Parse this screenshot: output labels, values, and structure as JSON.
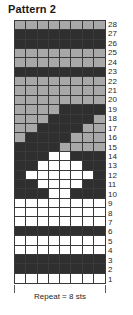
{
  "title": "Pattern 2",
  "footer": {
    "repeat_label": "Repeat = 8 sts"
  },
  "colors": {
    "light": "#a8a8a8",
    "dark": "#2f2f2f",
    "white": "#ffffff",
    "grid_line": "#3a3a3a",
    "text": "#1f1f1f"
  },
  "chart_data": {
    "type": "table",
    "title": "Pattern 2",
    "xlabel": "Repeat = 8 sts",
    "ylabel": "",
    "columns": 8,
    "rows": 28,
    "legend": [
      {
        "key": "L",
        "color": "#a8a8a8",
        "name": "light gray"
      },
      {
        "key": "D",
        "color": "#2f2f2f",
        "name": "dark gray"
      },
      {
        "key": "W",
        "color": "#ffffff",
        "name": "white"
      }
    ],
    "row_numbers": [
      28,
      27,
      26,
      25,
      24,
      23,
      22,
      21,
      20,
      19,
      18,
      17,
      16,
      15,
      14,
      13,
      12,
      11,
      10,
      9,
      8,
      7,
      6,
      5,
      4,
      3,
      2,
      1
    ],
    "grid_top_to_bottom": [
      [
        "L",
        "L",
        "L",
        "L",
        "L",
        "L",
        "L",
        "L"
      ],
      [
        "D",
        "D",
        "D",
        "D",
        "D",
        "D",
        "D",
        "D"
      ],
      [
        "D",
        "D",
        "D",
        "D",
        "D",
        "D",
        "D",
        "D"
      ],
      [
        "L",
        "L",
        "L",
        "L",
        "L",
        "L",
        "L",
        "L"
      ],
      [
        "L",
        "L",
        "L",
        "L",
        "L",
        "L",
        "L",
        "L"
      ],
      [
        "D",
        "D",
        "D",
        "D",
        "D",
        "D",
        "D",
        "D"
      ],
      [
        "L",
        "L",
        "L",
        "L",
        "L",
        "L",
        "L",
        "L"
      ],
      [
        "L",
        "L",
        "L",
        "L",
        "L",
        "L",
        "L",
        "L"
      ],
      [
        "L",
        "L",
        "L",
        "L",
        "L",
        "L",
        "L",
        "L"
      ],
      [
        "L",
        "L",
        "L",
        "L",
        "D",
        "D",
        "D",
        "D"
      ],
      [
        "L",
        "L",
        "L",
        "D",
        "D",
        "D",
        "D",
        "L"
      ],
      [
        "L",
        "L",
        "D",
        "D",
        "D",
        "D",
        "L",
        "L"
      ],
      [
        "L",
        "D",
        "D",
        "D",
        "D",
        "L",
        "L",
        "L"
      ],
      [
        "D",
        "D",
        "D",
        "D",
        "L",
        "L",
        "L",
        "L"
      ],
      [
        "D",
        "D",
        "D",
        "W",
        "W",
        "D",
        "D",
        "D"
      ],
      [
        "D",
        "D",
        "W",
        "W",
        "W",
        "W",
        "D",
        "D"
      ],
      [
        "D",
        "W",
        "W",
        "W",
        "W",
        "W",
        "W",
        "D"
      ],
      [
        "D",
        "D",
        "W",
        "W",
        "W",
        "W",
        "D",
        "D"
      ],
      [
        "D",
        "D",
        "D",
        "W",
        "W",
        "D",
        "D",
        "D"
      ],
      [
        "W",
        "W",
        "W",
        "W",
        "W",
        "W",
        "W",
        "W"
      ],
      [
        "W",
        "W",
        "W",
        "W",
        "W",
        "W",
        "W",
        "W"
      ],
      [
        "W",
        "W",
        "W",
        "W",
        "W",
        "W",
        "W",
        "W"
      ],
      [
        "D",
        "D",
        "D",
        "D",
        "D",
        "D",
        "D",
        "D"
      ],
      [
        "W",
        "W",
        "W",
        "W",
        "W",
        "W",
        "W",
        "W"
      ],
      [
        "W",
        "W",
        "W",
        "W",
        "W",
        "W",
        "W",
        "W"
      ],
      [
        "D",
        "D",
        "D",
        "D",
        "D",
        "D",
        "D",
        "D"
      ],
      [
        "D",
        "D",
        "D",
        "D",
        "D",
        "D",
        "D",
        "D"
      ],
      [
        "W",
        "W",
        "W",
        "W",
        "W",
        "W",
        "W",
        "W"
      ]
    ]
  }
}
